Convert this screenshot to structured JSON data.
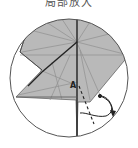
{
  "caption": "局部放大",
  "diagram": {
    "type": "origami-fold-detail",
    "point_label": "A",
    "colors": {
      "paper": "#b9b9b9",
      "crease": "#8f8f8f",
      "edge": "#333333",
      "circle": "#555555"
    }
  }
}
